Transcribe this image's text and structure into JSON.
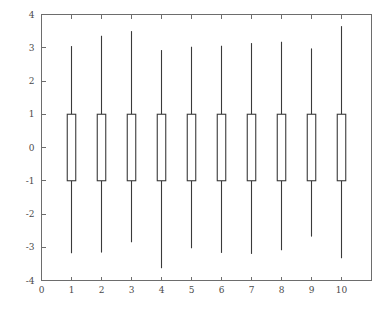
{
  "chart_data": {
    "type": "box",
    "title": "",
    "subtitle": "",
    "xlabel": "",
    "ylabel": "",
    "xlim": [
      0,
      11
    ],
    "ylim": [
      -4,
      4
    ],
    "grid": false,
    "legend": null,
    "background_color": "#ffffff",
    "axis_color": "#6d6d6d",
    "box_line_color": "#3a3a3a",
    "box_fill_color": "#ffffff",
    "x_ticks": [
      0,
      1,
      2,
      3,
      4,
      5,
      6,
      7,
      8,
      9,
      10
    ],
    "x_tick_labels": [
      "0",
      "1",
      "2",
      "3",
      "4",
      "5",
      "6",
      "7",
      "8",
      "9",
      "10"
    ],
    "y_ticks": [
      -4,
      -3,
      -2,
      -1,
      0,
      1,
      2,
      3,
      4
    ],
    "y_tick_labels": [
      "-4",
      "-3",
      "-2",
      "-1",
      "0",
      "1",
      "2",
      "3",
      "4"
    ],
    "categories": [
      "1",
      "2",
      "3",
      "4",
      "5",
      "6",
      "7",
      "8",
      "9",
      "10"
    ],
    "boxes": [
      {
        "label": "1",
        "x": 1,
        "whisker_low": -3.18,
        "q1": -1.0,
        "median": null,
        "q3": 1.0,
        "whisker_high": 3.05
      },
      {
        "label": "2",
        "x": 2,
        "whisker_low": -3.16,
        "q1": -1.0,
        "median": null,
        "q3": 1.0,
        "whisker_high": 3.36
      },
      {
        "label": "3",
        "x": 3,
        "whisker_low": -2.85,
        "q1": -1.0,
        "median": null,
        "q3": 1.0,
        "whisker_high": 3.5
      },
      {
        "label": "4",
        "x": 4,
        "whisker_low": -3.63,
        "q1": -1.0,
        "median": null,
        "q3": 1.0,
        "whisker_high": 2.93
      },
      {
        "label": "5",
        "x": 5,
        "whisker_low": -3.03,
        "q1": -1.0,
        "median": null,
        "q3": 1.0,
        "whisker_high": 3.03
      },
      {
        "label": "6",
        "x": 6,
        "whisker_low": -3.17,
        "q1": -1.0,
        "median": null,
        "q3": 1.0,
        "whisker_high": 3.06
      },
      {
        "label": "7",
        "x": 7,
        "whisker_low": -3.2,
        "q1": -1.0,
        "median": null,
        "q3": 1.0,
        "whisker_high": 3.14
      },
      {
        "label": "8",
        "x": 8,
        "whisker_low": -3.09,
        "q1": -1.0,
        "median": null,
        "q3": 1.0,
        "whisker_high": 3.18
      },
      {
        "label": "9",
        "x": 9,
        "whisker_low": -2.68,
        "q1": -1.0,
        "median": null,
        "q3": 1.0,
        "whisker_high": 2.98
      },
      {
        "label": "10",
        "x": 10,
        "whisker_low": -3.33,
        "q1": -1.0,
        "median": null,
        "q3": 1.0,
        "whisker_high": 3.65
      }
    ]
  }
}
